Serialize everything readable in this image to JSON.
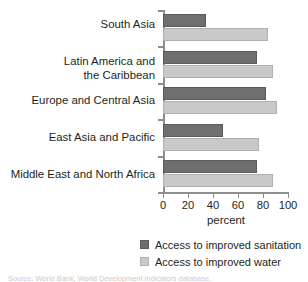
{
  "chart_data": {
    "type": "bar",
    "orientation": "horizontal",
    "title": "",
    "xlabel": "percent",
    "ylabel": "",
    "xlim": [
      0,
      100
    ],
    "xticks": [
      0,
      20,
      40,
      60,
      80,
      100
    ],
    "grid": false,
    "legend_position": "bottom-right",
    "categories": [
      "South Asia",
      "Latin America and\nthe Caribbean",
      "Europe and Central Asia",
      "East Asia and Pacific",
      "Middle East and North Africa"
    ],
    "series": [
      {
        "name": "Access to improved sanitation",
        "color": "#6f6f6f",
        "values": [
          34,
          75,
          82,
          48,
          75
        ]
      },
      {
        "name": "Access to improved water",
        "color": "#c9c9c9",
        "values": [
          84,
          88,
          91,
          77,
          88
        ]
      }
    ]
  },
  "axis": {
    "tick_labels": [
      "0",
      "20",
      "40",
      "60",
      "80",
      "100"
    ],
    "title": "percent"
  },
  "categories": [
    {
      "line1": "South Asia",
      "line2": ""
    },
    {
      "line1": "Latin America and",
      "line2": "the Caribbean"
    },
    {
      "line1": "Europe and Central Asia",
      "line2": ""
    },
    {
      "line1": "East Asia and Pacific",
      "line2": ""
    },
    {
      "line1": "Middle East and North Africa",
      "line2": ""
    }
  ],
  "legend": {
    "items": [
      {
        "label": "Access to improved sanitation"
      },
      {
        "label": "Access to improved water"
      }
    ]
  },
  "source_note": "Source: World Bank, World Development Indicators database."
}
